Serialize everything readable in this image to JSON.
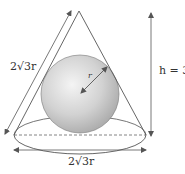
{
  "diagram": {
    "labels": {
      "slant_height": "2√3r",
      "height": "h = 3r",
      "base_diameter": "2√3r",
      "radius": "r"
    },
    "geometry": {
      "cone_apex": [
        79,
        11
      ],
      "base_center": [
        80,
        135
      ],
      "base_rx": 66,
      "base_ry": 19,
      "sphere_center": [
        80,
        94
      ],
      "sphere_radius": 39
    },
    "colors": {
      "line": "#555555",
      "sphere_light": "#f2f2f2",
      "sphere_dark": "#a8a8a8",
      "text": "#333333"
    }
  }
}
